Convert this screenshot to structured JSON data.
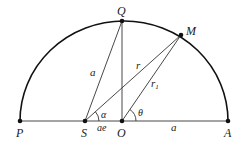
{
  "diagram": {
    "type": "geometry",
    "points": {
      "P": {
        "label": "P",
        "x": 20,
        "y": 121
      },
      "S": {
        "label": "S",
        "x": 85,
        "y": 121
      },
      "O": {
        "label": "O",
        "x": 122,
        "y": 121
      },
      "A": {
        "label": "A",
        "x": 228,
        "y": 121
      },
      "Q": {
        "label": "Q",
        "x": 122,
        "y": 21
      },
      "M": {
        "label": "M",
        "x": 181,
        "y": 35
      }
    },
    "segment_labels": {
      "SQ": "a",
      "SM": "r",
      "OM": "r",
      "OM_sub": "1",
      "SO": "ae",
      "OA": "a"
    },
    "angle_labels": {
      "at_S": "α",
      "at_O": "θ"
    },
    "colors": {
      "stroke": "#1a1a1a",
      "arc": "#111111"
    }
  }
}
